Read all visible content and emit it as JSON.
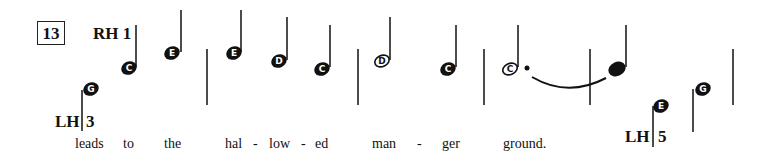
{
  "measure_number": "13",
  "hands": {
    "rh": {
      "label": "RH",
      "finger": "1"
    },
    "lh1": {
      "label": "LH",
      "finger": "3"
    },
    "lh2": {
      "label": "LH",
      "finger": "5"
    }
  },
  "notes": [
    {
      "name": "G",
      "type": "quarter",
      "x": 91,
      "y": 90,
      "stem": "up-left-low"
    },
    {
      "name": "C",
      "type": "quarter",
      "x": 129,
      "y": 68
    },
    {
      "name": "E",
      "type": "quarter",
      "x": 172,
      "y": 53
    },
    {
      "name": "E",
      "type": "quarter",
      "x": 234,
      "y": 53
    },
    {
      "name": "D",
      "type": "quarter",
      "x": 277,
      "y": 61
    },
    {
      "name": "C",
      "type": "quarter",
      "x": 320,
      "y": 69
    },
    {
      "name": "D",
      "type": "half",
      "x": 380,
      "y": 61
    },
    {
      "name": "C",
      "type": "quarter",
      "x": 447,
      "y": 69
    },
    {
      "name": "C",
      "type": "dotted-half",
      "x": 507,
      "y": 69
    },
    {
      "name": "",
      "type": "quarter-tied",
      "x": 617,
      "y": 68
    },
    {
      "name": "E",
      "type": "quarter",
      "x": 661,
      "y": 105
    },
    {
      "name": "G",
      "type": "quarter",
      "x": 704,
      "y": 89
    }
  ],
  "lyrics": [
    "leads",
    "to",
    "the",
    "hal",
    "-",
    "low",
    "-",
    "ed",
    "man",
    "-",
    "ger",
    "ground."
  ]
}
